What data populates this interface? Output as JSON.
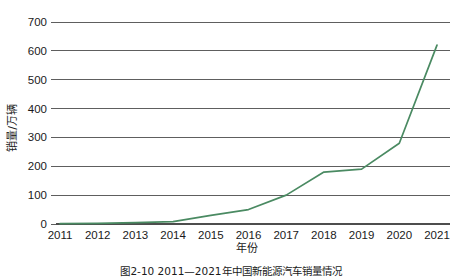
{
  "chart_data": {
    "type": "line",
    "title": "",
    "xlabel": "年份",
    "ylabel": "销量/万辆",
    "categories": [
      "2011",
      "2012",
      "2013",
      "2014",
      "2015",
      "2016",
      "2017",
      "2018",
      "2019",
      "2020",
      "2021"
    ],
    "x": [
      2011,
      2012,
      2013,
      2014,
      2015,
      2016,
      2017,
      2018,
      2019,
      2020,
      2021
    ],
    "series": [
      {
        "name": "销量",
        "color": "#4a8a62",
        "values": [
          1,
          2,
          5,
          8,
          30,
          50,
          100,
          180,
          190,
          280,
          620
        ]
      }
    ],
    "ylim": [
      0,
      700
    ],
    "yticks": [
      0,
      100,
      200,
      300,
      400,
      500,
      600,
      700
    ],
    "ytick_labels": [
      "0",
      "100",
      "200",
      "300",
      "400",
      "500",
      "600",
      "700"
    ],
    "xlim": [
      2011,
      2021
    ],
    "grid": true,
    "grid_axis": "y",
    "legend": "none",
    "markers": "none"
  },
  "caption": {
    "text": "图2-10  2011—2021年中国新能源汽车销量情况"
  },
  "colors": {
    "line": "#4a8a62",
    "axis": "#4d4d4d",
    "text": "#1a1a1a",
    "background": "#ffffff"
  }
}
